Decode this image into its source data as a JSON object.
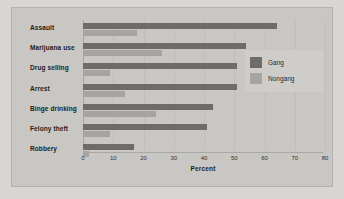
{
  "chart_data": {
    "type": "bar",
    "orientation": "horizontal",
    "title": "",
    "xlabel": "Percent",
    "ylabel": "",
    "xlim": [
      0,
      80
    ],
    "xticks": [
      "0",
      "10",
      "20",
      "30",
      "40",
      "50",
      "60",
      "70",
      "80"
    ],
    "grid": true,
    "legend_position": "top-right",
    "categories": [
      "Assault",
      "Marijuana use",
      "Drug selling",
      "Arrest",
      "Binge drinking",
      "Felony theft",
      "Robbery"
    ],
    "series": [
      {
        "name": "Gang",
        "color": "#6e6c69",
        "values": [
          64,
          54,
          51,
          51,
          43,
          41,
          17
        ]
      },
      {
        "name": "Nongang",
        "color": "#a6a4a0",
        "values": [
          18,
          26,
          9,
          14,
          24,
          9,
          2
        ]
      }
    ]
  },
  "legend": {
    "items": [
      {
        "label": "Gang",
        "swatch": "gang"
      },
      {
        "label": "Nongang",
        "swatch": "nongang"
      }
    ]
  },
  "colors": {
    "gang": "#6e6c69",
    "nongang": "#a6a4a0",
    "panel_background": "#c9c7c3",
    "page_background": "#d8d6d2",
    "gridline": "#bfbdb9"
  }
}
